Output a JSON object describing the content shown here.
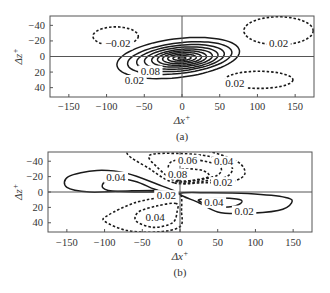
{
  "chart_data": [
    {
      "type": "contour",
      "panel_caption": "(a)",
      "xlabel": "Δx⁺",
      "ylabel": "Δz⁺",
      "xlim": [
        -175,
        175
      ],
      "ylim": [
        52,
        -52
      ],
      "x_ticks": [
        -150,
        -100,
        -50,
        0,
        50,
        100,
        150
      ],
      "y_ticks": [
        -40,
        -20,
        0,
        20,
        40
      ],
      "x_tick_labels": [
        "−150",
        "−100",
        "−50",
        "0",
        "50",
        "100",
        "150"
      ],
      "y_tick_labels": [
        "−40",
        "−20",
        "0",
        "20",
        "40"
      ],
      "grid": false,
      "zero_lines": true,
      "line_style_note": "solid = positive levels, dashed = negative levels",
      "contours": [
        {
          "level": 0.02,
          "style": "solid",
          "center": [
            -5,
            2
          ],
          "semi_axes": [
            85,
            24
          ],
          "tilt_deg": -22
        },
        {
          "level": 0.04,
          "style": "solid",
          "center": [
            -3,
            2
          ],
          "semi_axes": [
            72,
            19
          ],
          "tilt_deg": -20
        },
        {
          "level": 0.06,
          "style": "solid",
          "center": [
            -2,
            2
          ],
          "semi_axes": [
            60,
            16
          ],
          "tilt_deg": -18
        },
        {
          "level": 0.08,
          "style": "solid",
          "center": [
            -1,
            2
          ],
          "semi_axes": [
            50,
            13.5
          ],
          "tilt_deg": -16
        },
        {
          "level": 0.1,
          "style": "solid",
          "center": [
            0,
            2
          ],
          "semi_axes": [
            41,
            11
          ],
          "tilt_deg": -14
        },
        {
          "level": 0.12,
          "style": "solid",
          "center": [
            0,
            2
          ],
          "semi_axes": [
            33,
            9
          ],
          "tilt_deg": -12
        },
        {
          "level": 0.14,
          "style": "solid",
          "center": [
            0,
            2
          ],
          "semi_axes": [
            26,
            7
          ],
          "tilt_deg": -10
        },
        {
          "level": 0.16,
          "style": "solid",
          "center": [
            0,
            2
          ],
          "semi_axes": [
            19,
            5
          ],
          "tilt_deg": -8
        },
        {
          "level": 0.18,
          "style": "solid",
          "center": [
            0,
            2
          ],
          "semi_axes": [
            12,
            3
          ],
          "tilt_deg": -6
        },
        {
          "level": 0.2,
          "style": "solid",
          "center": [
            0,
            2
          ],
          "semi_axes": [
            5,
            1.5
          ],
          "tilt_deg": 0
        },
        {
          "level": -0.02,
          "style": "dashed",
          "center": [
            -88,
            -26
          ],
          "semi_axes": [
            30,
            12
          ],
          "tilt_deg": 0
        },
        {
          "level": -0.02,
          "style": "dashed",
          "center": [
            128,
            -33
          ],
          "semi_axes": [
            46,
            18
          ],
          "tilt_deg": 0
        },
        {
          "level": -0.02,
          "style": "dashed",
          "center": [
            102,
            30
          ],
          "semi_axes": [
            45,
            11
          ],
          "tilt_deg": 0
        }
      ],
      "contour_labels": [
        {
          "text": "−0.02",
          "x": -85,
          "y": -13
        },
        {
          "text": "0.02",
          "x": 128,
          "y": -13
        },
        {
          "text": "0.02",
          "x": 70,
          "y": 38
        },
        {
          "text": "0.08",
          "x": -42,
          "y": 22
        },
        {
          "text": "0.02",
          "x": -63,
          "y": 34
        }
      ]
    },
    {
      "type": "contour",
      "panel_caption": "(b)",
      "xlabel": "Δx⁺",
      "ylabel": "Δz⁺",
      "xlim": [
        -175,
        175
      ],
      "ylim": [
        52,
        -52
      ],
      "x_ticks": [
        -150,
        -100,
        -50,
        0,
        50,
        100,
        150
      ],
      "y_ticks": [
        -40,
        -20,
        0,
        20,
        40
      ],
      "x_tick_labels": [
        "−150",
        "−100",
        "−50",
        "0",
        "50",
        "100",
        "150"
      ],
      "y_tick_labels": [
        "−40",
        "−20",
        "0",
        "20",
        "40"
      ],
      "grid": false,
      "zero_lines": true,
      "line_style_note": "solid = positive levels, dashed = negative levels",
      "contours": [
        {
          "level": 0.02,
          "style": "solid",
          "lobe": "left",
          "tip": [
            -152,
            -10
          ],
          "extent": [
            -155,
            0
          ],
          "z_range": [
            -30,
            2
          ]
        },
        {
          "level": 0.04,
          "style": "solid",
          "lobe": "left-inner",
          "tip": [
            -103,
            -8
          ],
          "extent": [
            -103,
            -30
          ],
          "z_range": [
            -20,
            0
          ]
        },
        {
          "level": 0.02,
          "style": "solid",
          "lobe": "right",
          "tip": [
            148,
            13
          ],
          "extent": [
            0,
            150
          ],
          "z_range": [
            0,
            29
          ]
        },
        {
          "level": 0.04,
          "style": "solid",
          "lobe": "right-inner",
          "tip": [
            82,
            12
          ],
          "extent": [
            25,
            82
          ],
          "z_range": [
            7,
            20
          ]
        },
        {
          "level": -0.02,
          "style": "dashed",
          "lobe": "upper",
          "extent": [
            -70,
            86
          ],
          "z_range": [
            -52,
            -10
          ]
        },
        {
          "level": -0.04,
          "style": "dashed",
          "lobe": "upper",
          "extent": [
            -45,
            70
          ],
          "z_range": [
            -48,
            -12
          ]
        },
        {
          "level": -0.06,
          "style": "dashed",
          "lobe": "upper",
          "extent": [
            -25,
            55
          ],
          "z_range": [
            -42,
            -14
          ]
        },
        {
          "level": -0.08,
          "style": "dashed",
          "lobe": "upper",
          "extent": [
            -10,
            40
          ],
          "z_range": [
            -34,
            -14
          ]
        },
        {
          "level": -0.02,
          "style": "dashed",
          "lobe": "lower",
          "extent": [
            -100,
            2
          ],
          "z_range": [
            2,
            52
          ]
        },
        {
          "level": -0.04,
          "style": "dashed",
          "lobe": "lower",
          "extent": [
            -60,
            -5
          ],
          "z_range": [
            18,
            48
          ]
        }
      ],
      "contour_labels": [
        {
          "text": "0.04",
          "x": -85,
          "y": -16
        },
        {
          "text": "0.06",
          "x": 10,
          "y": -38
        },
        {
          "text": "0.04",
          "x": 58,
          "y": -36
        },
        {
          "text": "0.08",
          "x": -3,
          "y": -20
        },
        {
          "text": "0.02",
          "x": 57,
          "y": -9
        },
        {
          "text": "0.02",
          "x": -18,
          "y": 8
        },
        {
          "text": "0.04",
          "x": 45,
          "y": 17
        },
        {
          "text": "0.02",
          "x": 85,
          "y": 28
        },
        {
          "text": "0.04",
          "x": -33,
          "y": 36
        }
      ]
    }
  ],
  "panels": [
    {
      "caption": "(a)",
      "xlabel": "Δx",
      "xlabel_sup": "+",
      "ylabel": "Δz",
      "ylabel_sup": "+"
    },
    {
      "caption": "(b)",
      "xlabel": "Δx",
      "xlabel_sup": "+",
      "ylabel": "Δz",
      "ylabel_sup": "+"
    }
  ],
  "style": {
    "line_color": "#1a1a1a",
    "axis_color": "#555555",
    "text_color": "#333333"
  }
}
